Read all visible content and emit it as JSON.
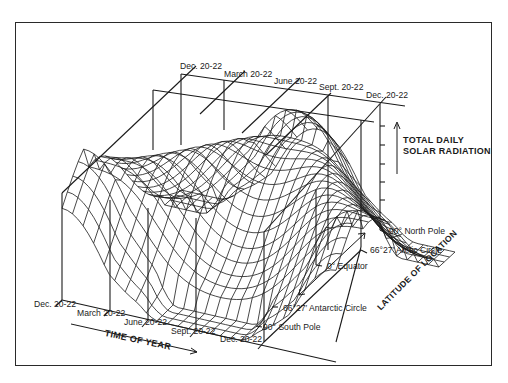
{
  "diagram": {
    "back_time_labels": [
      "Dec. 20-22",
      "March 20-22",
      "June 20-22",
      "Sept. 20-22",
      "Dec. 20-22"
    ],
    "front_time_labels": [
      "Dec. 20-22",
      "March 20-22",
      "June 20-22",
      "Sept. 20-22",
      "Dec. 20-22"
    ],
    "latitude_labels": {
      "north_pole": "90° North Pole",
      "arctic_circle": "66°27′ Arctic Circle",
      "equator": "0° Equator",
      "antarctic_circle": "66°27′ Antarctic Circle",
      "south_pole": "90° South Pole"
    },
    "axis_titles": {
      "z_line1": "TOTAL DAILY",
      "z_line2": "SOLAR RADIATION",
      "x": "TIME OF YEAR",
      "y": "LATITUDE OF LOCATION"
    },
    "icons": {
      "z_arrow": "arrow-up-icon",
      "x_arrow": "arrow-right-icon",
      "y_arrow": "double-arrow-icon"
    },
    "colors": {
      "ink": "#1a1a1a",
      "background": "#ffffff"
    }
  }
}
